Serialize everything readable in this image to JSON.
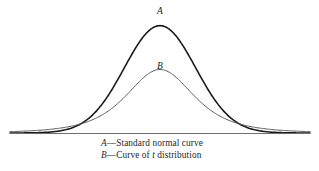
{
  "figure": {
    "background_color": "#ffffff",
    "baseline_color": "#6e6e6e"
  },
  "labels": {
    "curve_a": "A",
    "curve_b": "B"
  },
  "legend": {
    "items": [
      {
        "key": "A",
        "dash": "—",
        "text_before": "Standard normal curve",
        "var": "",
        "text_after": ""
      },
      {
        "key": "B",
        "dash": "—",
        "text_before": "Curve of ",
        "var": "t",
        "text_after": " distribution"
      }
    ]
  },
  "chart_data": {
    "type": "line",
    "title": "",
    "subtitle": "",
    "xlabel": "",
    "ylabel": "",
    "grid": false,
    "legend_position": "below",
    "axis": {
      "baseline_y_px": 133,
      "x_range_px": [
        10,
        310
      ],
      "center_x_px": 160,
      "x_domain": [
        -4.2,
        4.2
      ],
      "y_domain": [
        0,
        0.42
      ]
    },
    "series": [
      {
        "name": "A",
        "label": "Standard normal curve",
        "distribution": "normal",
        "mean": 0,
        "sd": 1,
        "color": "#1a1a1a",
        "stroke_width": 1.6,
        "peak_value": 0.399,
        "peak_x": 0,
        "x": [
          -4.2,
          -3.6,
          -3.0,
          -2.6,
          -2.2,
          -1.8,
          -1.4,
          -1.0,
          -0.6,
          -0.2,
          0.0,
          0.2,
          0.6,
          1.0,
          1.4,
          1.8,
          2.2,
          2.6,
          3.0,
          3.6,
          4.2
        ],
        "y": [
          0.0001,
          0.0006,
          0.0044,
          0.0136,
          0.0355,
          0.079,
          0.1497,
          0.242,
          0.3332,
          0.391,
          0.3989,
          0.391,
          0.3332,
          0.242,
          0.1497,
          0.079,
          0.0355,
          0.0136,
          0.0044,
          0.0006,
          0.0001
        ]
      },
      {
        "name": "B",
        "label": "Curve of t distribution",
        "distribution": "t",
        "df": 3,
        "color": "#5a5a5a",
        "stroke_width": 1.0,
        "peak_value": 0.236,
        "peak_x": 0,
        "x": [
          -4.2,
          -3.6,
          -3.0,
          -2.6,
          -2.2,
          -1.8,
          -1.4,
          -1.0,
          -0.6,
          -0.2,
          0.0,
          0.2,
          0.6,
          1.0,
          1.4,
          1.8,
          2.2,
          2.6,
          3.0,
          3.6,
          4.2
        ],
        "y": [
          0.0068,
          0.0105,
          0.0168,
          0.0229,
          0.0325,
          0.0474,
          0.0704,
          0.1037,
          0.146,
          0.18,
          0.1836,
          0.18,
          0.146,
          0.1037,
          0.0704,
          0.0474,
          0.0325,
          0.0229,
          0.0168,
          0.0105,
          0.0068
        ]
      }
    ],
    "annotations": [
      {
        "text": "A",
        "x_px": 160,
        "y_px": 14,
        "style": "italic"
      },
      {
        "text": "B",
        "x_px": 160,
        "y_px": 69,
        "style": "italic"
      }
    ]
  }
}
